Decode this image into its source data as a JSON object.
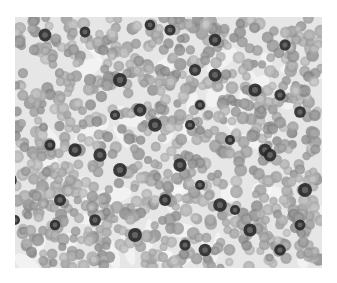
{
  "image": {
    "subject": "micrograph of densely packed round cells with scattered darkly stained cells",
    "background_color": "#ffffff",
    "frame": {
      "x": 15,
      "y": 17,
      "width": 307,
      "height": 251
    },
    "colors": {
      "field": "#d6d6d6",
      "cell_light": "#9a9a9a",
      "cell_dark": "#2a2a2a",
      "gap": "#eeeeee"
    }
  }
}
